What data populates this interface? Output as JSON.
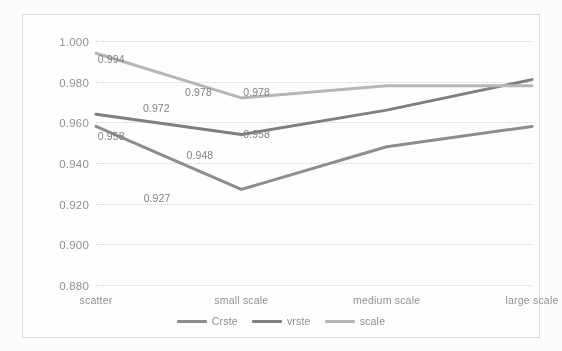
{
  "chart_data": {
    "type": "line",
    "title": "",
    "xlabel": "",
    "ylabel": "",
    "categories": [
      "scatter",
      "small scale",
      "medium scale",
      "large scale"
    ],
    "ylim": [
      0.88,
      1.0
    ],
    "yticks": [
      "0.880",
      "0.900",
      "0.920",
      "0.940",
      "0.960",
      "0.980",
      "1.000"
    ],
    "ytick_values": [
      0.88,
      0.9,
      0.92,
      0.94,
      0.96,
      0.98,
      1.0
    ],
    "grid": true,
    "legend_position": "bottom-center",
    "series": [
      {
        "name": "Crste",
        "color": "#8a8a8a",
        "values": [
          0.958,
          0.927,
          0.948,
          0.958
        ],
        "labels": [
          "0.958",
          "0.927",
          "0.948",
          "0.958"
        ],
        "show_labels": [
          true,
          true,
          true,
          true
        ]
      },
      {
        "name": "vrste",
        "color": "#7b7b7b",
        "values": [
          0.964,
          0.954,
          0.966,
          0.981
        ],
        "labels": [
          "",
          "",
          "",
          ""
        ],
        "show_labels": [
          false,
          false,
          false,
          false
        ]
      },
      {
        "name": "scale",
        "color": "#b4b4b4",
        "values": [
          0.994,
          0.972,
          0.978,
          0.978
        ],
        "labels": [
          "0.994",
          "0.972",
          "0.978",
          "0.978"
        ],
        "show_labels": [
          true,
          true,
          true,
          true
        ]
      }
    ],
    "data_labels": [
      {
        "text": "0.994",
        "x": 0.105,
        "y": 0.9955,
        "anchor": "series-scale"
      },
      {
        "text": "0.972",
        "x": 0.415,
        "y": 0.9715,
        "anchor": "series-scale"
      },
      {
        "text": "0.978",
        "x": 0.705,
        "y": 0.9795,
        "anchor": "series-scale"
      },
      {
        "text": "0.978",
        "x": 1.105,
        "y": 0.9795,
        "anchor": "series-scale"
      },
      {
        "text": "0.958",
        "x": 0.105,
        "y": 0.9575,
        "anchor": "series-crste"
      },
      {
        "text": "0.927",
        "x": 0.42,
        "y": 0.927,
        "anchor": "series-crste"
      },
      {
        "text": "0.948",
        "x": 0.715,
        "y": 0.9485,
        "anchor": "series-crste"
      },
      {
        "text": "0.958",
        "x": 1.105,
        "y": 0.9585,
        "anchor": "series-crste"
      }
    ]
  },
  "colors": {
    "grid": "#d2d2d2",
    "axis_text": "#8d8d8d",
    "frame": "#dcdcdc",
    "background": "#ffffff"
  }
}
